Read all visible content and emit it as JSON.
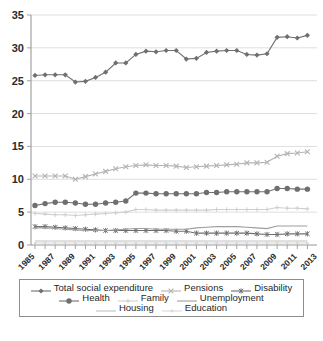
{
  "chart_data": {
    "type": "line",
    "title": "",
    "xlabel": "",
    "ylabel": "",
    "ylim": [
      0,
      35
    ],
    "ytick_values": [
      0,
      5,
      10,
      15,
      20,
      25,
      30,
      35
    ],
    "grid": true,
    "legend_position": "bottom",
    "x": [
      1985,
      1986,
      1987,
      1988,
      1989,
      1990,
      1991,
      1992,
      1993,
      1994,
      1995,
      1996,
      1997,
      1998,
      1999,
      2000,
      2001,
      2002,
      2003,
      2004,
      2005,
      2006,
      2007,
      2008,
      2009,
      2010,
      2011,
      2012
    ],
    "xtick_labels": [
      "1985",
      "1987",
      "1989",
      "1991",
      "1993",
      "1995",
      "1997",
      "1999",
      "2001",
      "2003",
      "2005",
      "2007",
      "2009",
      "2011",
      "2013"
    ],
    "series": [
      {
        "name": "Total social expenditure",
        "marker": "diamond",
        "color": "#6f6f6f",
        "values": [
          25.8,
          25.9,
          25.9,
          25.9,
          24.8,
          24.9,
          25.5,
          26.3,
          27.7,
          27.7,
          29.0,
          29.5,
          29.4,
          29.6,
          29.6,
          28.3,
          28.4,
          29.3,
          29.5,
          29.6,
          29.6,
          29.0,
          28.9,
          29.1,
          31.6,
          31.7,
          31.5,
          31.9
        ]
      },
      {
        "name": "Pensions",
        "marker": "x",
        "color": "#b3b3b3",
        "values": [
          10.5,
          10.5,
          10.5,
          10.5,
          10.0,
          10.4,
          10.8,
          11.2,
          11.6,
          11.9,
          12.1,
          12.2,
          12.1,
          12.1,
          12.0,
          11.8,
          11.9,
          12.0,
          12.1,
          12.2,
          12.3,
          12.5,
          12.5,
          12.6,
          13.5,
          13.9,
          14.0,
          14.2
        ]
      },
      {
        "name": "Disability",
        "marker": "asterisk",
        "color": "#6f6f6f",
        "values": [
          2.8,
          2.8,
          2.7,
          2.6,
          2.5,
          2.4,
          2.3,
          2.2,
          2.2,
          2.2,
          2.2,
          2.2,
          2.2,
          2.2,
          2.1,
          2.1,
          1.8,
          1.8,
          1.8,
          1.8,
          1.8,
          1.8,
          1.7,
          1.6,
          1.6,
          1.7,
          1.7,
          1.7
        ]
      },
      {
        "name": "Health",
        "marker": "circle",
        "color": "#6f6f6f",
        "values": [
          6.0,
          6.3,
          6.5,
          6.5,
          6.4,
          6.2,
          6.2,
          6.4,
          6.5,
          6.7,
          7.9,
          7.9,
          7.8,
          7.8,
          7.8,
          7.8,
          7.8,
          8.0,
          8.0,
          8.1,
          8.1,
          8.1,
          8.1,
          8.1,
          8.6,
          8.6,
          8.5,
          8.5
        ]
      },
      {
        "name": "Family",
        "marker": "plus-small",
        "color": "#cfcfcf",
        "values": [
          4.8,
          4.7,
          4.6,
          4.6,
          4.5,
          4.6,
          4.7,
          4.8,
          4.9,
          5.0,
          5.4,
          5.4,
          5.3,
          5.3,
          5.3,
          5.3,
          5.3,
          5.3,
          5.4,
          5.4,
          5.4,
          5.4,
          5.4,
          5.4,
          5.7,
          5.6,
          5.6,
          5.5
        ]
      },
      {
        "name": "Unemployment",
        "marker": "none",
        "color": "#9e9e9e",
        "values": [
          2.6,
          2.6,
          2.5,
          2.4,
          2.3,
          2.2,
          2.2,
          2.2,
          2.3,
          2.4,
          2.5,
          2.5,
          2.4,
          2.4,
          2.4,
          2.4,
          2.6,
          2.7,
          2.8,
          2.8,
          2.8,
          2.7,
          2.6,
          2.5,
          2.9,
          2.9,
          2.9,
          2.9
        ]
      },
      {
        "name": "Housing",
        "marker": "none",
        "color": "#c2c2c2",
        "values": [
          0.6,
          0.6,
          0.6,
          0.6,
          0.6,
          0.6,
          0.6,
          0.6,
          0.6,
          0.6,
          0.6,
          0.6,
          0.6,
          0.6,
          0.6,
          0.6,
          0.6,
          0.6,
          0.6,
          0.6,
          0.6,
          0.6,
          0.6,
          0.6,
          0.6,
          0.6,
          0.6,
          0.6
        ]
      },
      {
        "name": "Education",
        "marker": "dot-small",
        "color": "#d9d9d9",
        "values": [
          0.3,
          0.3,
          0.3,
          0.3,
          0.3,
          0.3,
          0.3,
          0.3,
          0.3,
          0.3,
          0.3,
          0.3,
          0.3,
          0.3,
          0.3,
          0.3,
          0.3,
          0.3,
          0.3,
          0.3,
          0.3,
          0.3,
          0.3,
          0.3,
          0.3,
          0.3,
          0.3,
          0.3
        ]
      }
    ]
  },
  "legend": {
    "rows": [
      [
        {
          "label": "Total social expenditure",
          "series": 0
        },
        {
          "label": "Pensions",
          "series": 1
        },
        {
          "label": "Disability",
          "series": 2
        }
      ],
      [
        {
          "label": "Health",
          "series": 3
        },
        {
          "label": "Family",
          "series": 4
        },
        {
          "label": "Unemployment",
          "series": 5
        }
      ],
      [
        {
          "label": "Housing",
          "series": 6
        },
        {
          "label": "Education",
          "series": 7
        }
      ]
    ]
  }
}
